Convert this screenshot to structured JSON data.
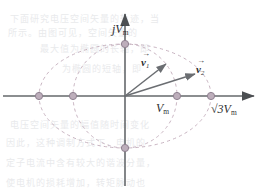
{
  "figure": {
    "background_color": "#ffffff",
    "axis_color": "#6a6d70",
    "curve_color": "#c9b9c4",
    "vector_color": "#6b6e72",
    "marker_fill": "#b9a9b6",
    "marker_stroke": "#8d7f8a",
    "label_color": "#2f3032"
  },
  "axes": {
    "origin": {
      "x": 125,
      "y": 96
    },
    "x_axis": {
      "x_start": 3,
      "x_end": 258,
      "arrow": "right"
    },
    "y_axis": {
      "y_start": 10,
      "y_end": 186,
      "arrow": "up"
    },
    "vertical_axis_label": "j",
    "vertical_axis_value": "V",
    "vertical_axis_sub": "m"
  },
  "labels": {
    "j_vm": {
      "text": "jV",
      "sub": "m",
      "x": 113,
      "y": 24
    },
    "vm": {
      "text": "V",
      "sub": "m",
      "x": 159,
      "y": 103
    },
    "sqrt3_vm": {
      "text": "√3V",
      "sub": "m",
      "x": 213,
      "y": 104
    }
  },
  "vectors": [
    {
      "name": "v",
      "index": "1",
      "label_x": 141,
      "label_y": 52,
      "tip_x": 167,
      "tip_y": 63,
      "tail_x": 125,
      "tail_y": 96
    },
    {
      "name": "v",
      "index": "2",
      "label_x": 196,
      "label_y": 59,
      "tip_x": 196,
      "tip_y": 73,
      "tail_x": 125,
      "tail_y": 96
    }
  ],
  "curves": [
    {
      "name": "outer-ellipse",
      "type": "ellipse",
      "cx": 125,
      "cy": 96,
      "rx": 86,
      "ry": 52,
      "style": "dashed"
    },
    {
      "name": "inner-circle",
      "type": "circle",
      "cx": 125,
      "cy": 96,
      "r": 52,
      "style": "dashed"
    }
  ],
  "markers": [
    {
      "name": "marker-neg-sqrt3-vm",
      "x": 39,
      "y": 96
    },
    {
      "name": "marker-neg-vm",
      "x": 73,
      "y": 96
    },
    {
      "name": "marker-pos-vm",
      "x": 177,
      "y": 96
    },
    {
      "name": "marker-pos-sqrt3-vm",
      "x": 211,
      "y": 96
    },
    {
      "name": "marker-pos-j-vm",
      "x": 125,
      "y": 44
    },
    {
      "name": "marker-neg-j-vm",
      "x": 125,
      "y": 148
    }
  ],
  "watermark_lines": [
    {
      "text": "下面研究电压空间矢量的轨迹，当",
      "x": 10,
      "y": 12
    },
    {
      "text": "所示。由图可见，空间矢量的",
      "x": 8,
      "y": 26
    },
    {
      "text": "最大值为椭圆的长轴，即",
      "x": 40,
      "y": 42
    },
    {
      "text": "为椭圆的短轴，即",
      "x": 62,
      "y": 62
    },
    {
      "text": "电压空间矢量的幅值随时间变化",
      "x": 10,
      "y": 118
    },
    {
      "text": "因此，这种调制方式下，电机的",
      "x": 6,
      "y": 136
    },
    {
      "text": "定子电流中含有较大的谐波分量，",
      "x": 6,
      "y": 156
    },
    {
      "text": "使电机的损耗增加，转矩脉动也",
      "x": 6,
      "y": 176
    }
  ]
}
